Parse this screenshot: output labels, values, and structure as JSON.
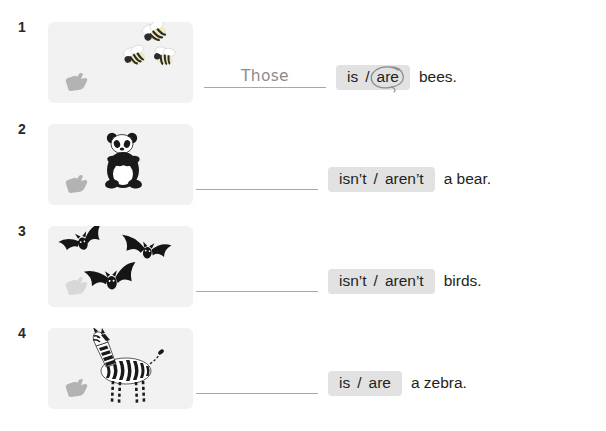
{
  "page": {
    "background_color": "#ffffff",
    "panel_color": "#f2f2f2",
    "highlight_color": "#e2e2e2",
    "text_color": "#231f20",
    "handwriting_color": "#8c8c8c",
    "line_color": "#a8a8a8"
  },
  "items": [
    {
      "number": "1",
      "picture": {
        "name": "bees-illustration",
        "subject": "bees",
        "count": 3,
        "pointer_icon": "pointing-hand-icon"
      },
      "answer": "Those",
      "choices": [
        "is",
        "are"
      ],
      "separator": "/",
      "circled": "are",
      "tail": "bees."
    },
    {
      "number": "2",
      "picture": {
        "name": "panda-illustration",
        "subject": "panda",
        "count": 1,
        "pointer_icon": "pointing-hand-icon"
      },
      "answer": "",
      "choices": [
        "isn’t",
        "aren’t"
      ],
      "separator": "/",
      "circled": "",
      "tail": "a bear."
    },
    {
      "number": "3",
      "picture": {
        "name": "bats-illustration",
        "subject": "bats",
        "count": 3,
        "pointer_icon": "pointing-hand-icon"
      },
      "answer": "",
      "choices": [
        "isn’t",
        "aren’t"
      ],
      "separator": "/",
      "circled": "",
      "tail": "birds."
    },
    {
      "number": "4",
      "picture": {
        "name": "zebra-illustration",
        "subject": "zebra",
        "count": 1,
        "pointer_icon": "pointing-hand-icon"
      },
      "answer": "",
      "choices": [
        "is",
        "are"
      ],
      "separator": "/",
      "circled": "",
      "tail": "a zebra."
    }
  ]
}
